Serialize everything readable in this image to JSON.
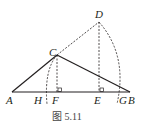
{
  "figure": {
    "caption": "图 5.11",
    "points": {
      "A": {
        "label": "A",
        "x": 12,
        "y": 92
      },
      "B": {
        "label": "B",
        "x": 130,
        "y": 92
      },
      "C": {
        "label": "C",
        "x": 57,
        "y": 55
      },
      "D": {
        "label": "D",
        "x": 99,
        "y": 22
      },
      "E": {
        "label": "E",
        "x": 99,
        "y": 92
      },
      "F": {
        "label": "F",
        "x": 57,
        "y": 92
      },
      "G": {
        "label": "G",
        "x": 121,
        "y": 92
      },
      "H": {
        "label": "H",
        "x": 44,
        "y": 92
      }
    },
    "solid_segments": [
      "AB",
      "AC",
      "CB"
    ],
    "dashed_segments": [
      "CD",
      "DE",
      "CF"
    ],
    "dashed_arcs": [
      "arc through C to H",
      "arc through D to G"
    ],
    "right_angle_marks": [
      "F",
      "E"
    ],
    "colors": {
      "line": "#231f20",
      "dashed": "#231f20"
    }
  }
}
